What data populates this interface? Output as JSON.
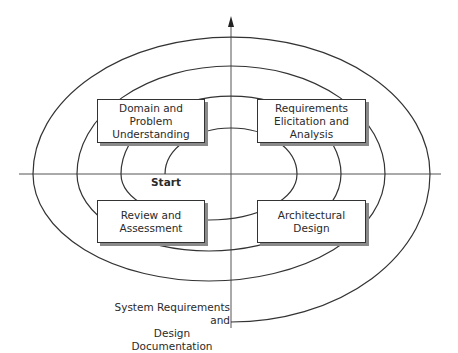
{
  "diagram": {
    "type": "spiral-process-model",
    "axes": {
      "vertical_arrow": "up",
      "horizontal": "line"
    },
    "start_label": "Start",
    "end_label": {
      "line1": "System Requirements and",
      "line2": "Design Documentation"
    },
    "quadrants": [
      {
        "id": "top-left",
        "line1": "Domain and Problem",
        "line2": "Understanding",
        "line3": ""
      },
      {
        "id": "top-right",
        "line1": "Requirements",
        "line2": "Elicitation and",
        "line3": "Analysis"
      },
      {
        "id": "bottom-left",
        "line1": "Review and",
        "line2": "Assessment",
        "line3": ""
      },
      {
        "id": "bottom-right",
        "line1": "Architectural",
        "line2": "Design",
        "line3": ""
      }
    ],
    "colors": {
      "line": "#333333",
      "shadow": "#8a8a8a",
      "background": "#ffffff"
    }
  }
}
